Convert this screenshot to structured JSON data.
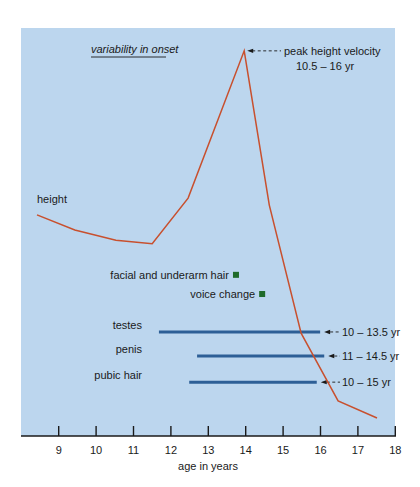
{
  "chart_data": {
    "type": "line",
    "title": "",
    "xlabel": "age in years",
    "ylabel": "",
    "xlim": [
      8,
      18
    ],
    "ylim": [
      0,
      100
    ],
    "x_ticks": [
      9,
      10,
      11,
      12,
      13,
      14,
      15,
      16,
      17,
      18
    ],
    "grid": false,
    "background_color": "#bcd6ee",
    "annotation_heading": "variability in onset",
    "series": [
      {
        "name": "height",
        "color": "#c8502e",
        "x": [
          8.42,
          9.43,
          10.53,
          11.5,
          12.46,
          13.96,
          14.63,
          15.48,
          16.47,
          17.51
        ],
        "y": [
          54.2,
          50.5,
          48.0,
          47.1,
          58.3,
          94.4,
          56.6,
          25.2,
          8.6,
          4.4
        ]
      }
    ],
    "peak_annotation": {
      "label": "peak height velocity",
      "range": "10.5 – 16 yr",
      "x": 13.96,
      "y": 94.4
    },
    "markers": [
      {
        "name": "facial and underarm hair",
        "x": 13.74,
        "y": 39.5,
        "color": "#1f6b2a"
      },
      {
        "name": "voice change",
        "x": 14.44,
        "y": 34.8,
        "color": "#1f6b2a"
      }
    ],
    "ranges": [
      {
        "name": "testes",
        "start": 11.68,
        "end": 15.99,
        "y": 25.5,
        "range_label": "10 – 13.5 yr",
        "color": "#2d5f96"
      },
      {
        "name": "penis",
        "start": 12.7,
        "end": 16.1,
        "y": 19.6,
        "range_label": "11 – 14.5 yr",
        "color": "#2d5f96"
      },
      {
        "name": "pubic hair",
        "start": 12.49,
        "end": 15.9,
        "y": 13.2,
        "range_label": "10 – 15 yr",
        "color": "#2d5f96"
      }
    ]
  }
}
